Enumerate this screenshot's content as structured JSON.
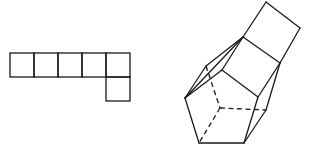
{
  "diagram": {
    "stroke_color": "#1a1a1a",
    "background": "#ffffff",
    "net": {
      "cell_size": 24,
      "cells": [
        {
          "x": 10,
          "y": 53
        },
        {
          "x": 34,
          "y": 53
        },
        {
          "x": 58,
          "y": 53
        },
        {
          "x": 82,
          "y": 53
        },
        {
          "x": 106,
          "y": 53
        },
        {
          "x": 106,
          "y": 77
        }
      ]
    },
    "solid": {
      "solid_edges": [
        [
          [
            266,
            2
          ],
          [
            300,
            28
          ]
        ],
        [
          [
            300,
            28
          ],
          [
            280,
            63
          ]
        ],
        [
          [
            280,
            63
          ],
          [
            243,
            37
          ]
        ],
        [
          [
            243,
            37
          ],
          [
            266,
            2
          ]
        ],
        [
          [
            243,
            37
          ],
          [
            222,
            70
          ]
        ],
        [
          [
            280,
            63
          ],
          [
            258,
            97
          ]
        ],
        [
          [
            222,
            70
          ],
          [
            258,
            97
          ]
        ],
        [
          [
            243,
            37
          ],
          [
            206,
            66
          ]
        ],
        [
          [
            206,
            66
          ],
          [
            185,
            98
          ]
        ],
        [
          [
            243,
            37
          ],
          [
            185,
            98
          ]
        ],
        [
          [
            222,
            70
          ],
          [
            185,
            98
          ]
        ],
        [
          [
            185,
            98
          ],
          [
            199,
            143
          ]
        ],
        [
          [
            199,
            143
          ],
          [
            244,
            143
          ]
        ],
        [
          [
            244,
            143
          ],
          [
            258,
            97
          ]
        ],
        [
          [
            280,
            63
          ],
          [
            266,
            110
          ]
        ],
        [
          [
            266,
            110
          ],
          [
            244,
            143
          ]
        ]
      ],
      "dashed_edges": [
        [
          [
            206,
            66
          ],
          [
            220,
            108
          ]
        ],
        [
          [
            220,
            108
          ],
          [
            199,
            143
          ]
        ],
        [
          [
            220,
            108
          ],
          [
            266,
            110
          ]
        ]
      ]
    }
  }
}
